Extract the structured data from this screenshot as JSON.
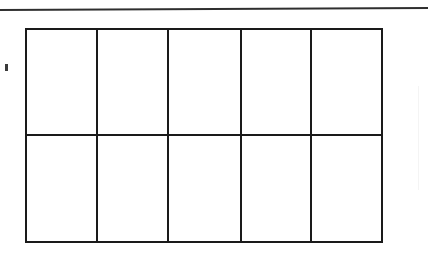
{
  "document": {
    "type": "scanned-page",
    "background_color": "#ffffff",
    "ink_color": "#1a1a1a"
  },
  "rules": {
    "top_rule": {
      "name": "horizontal-rule",
      "x": 0,
      "y": 9,
      "width": 428,
      "height": 2,
      "color": "#1d1d1d"
    },
    "faint_right_rule": {
      "name": "faint-vertical-rule",
      "x": 418,
      "y": 86,
      "width": 1,
      "height": 104,
      "color": "#000000"
    }
  },
  "artifacts": [
    {
      "name": "scan-speck",
      "x": 5,
      "y": 64,
      "width": 3,
      "height": 7,
      "color": "#262626"
    }
  ],
  "table": {
    "name": "empty-table-grid",
    "x": 25,
    "y": 28,
    "width": 358,
    "height": 215,
    "columns": 5,
    "rows": 2,
    "border_color": "#1a1a1a",
    "border_width": 2,
    "column_x": [
      0,
      71,
      142,
      215,
      285,
      356
    ],
    "row_y": [
      0,
      106,
      213
    ],
    "headers": [
      "",
      "",
      "",
      "",
      ""
    ],
    "cells": [
      [
        "",
        "",
        "",
        "",
        ""
      ],
      [
        "",
        "",
        "",
        "",
        ""
      ]
    ]
  }
}
